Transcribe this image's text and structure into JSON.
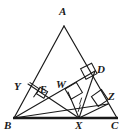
{
  "figure": {
    "type": "geometry-diagram",
    "background_color": "#ffffff",
    "stroke_color": "#1a1a1a",
    "label_color": "#1a1a1a",
    "canvas": {
      "width": 129,
      "height": 135
    }
  },
  "labels": {
    "A": "A",
    "B": "B",
    "C": "C",
    "D": "D",
    "E": "E",
    "W": "W",
    "X": "X",
    "Y": "Y",
    "Z": "Z"
  },
  "points": {
    "A": {
      "x": 64,
      "y": 26
    },
    "B": {
      "x": 14,
      "y": 118
    },
    "C": {
      "x": 117,
      "y": 118
    },
    "D": {
      "x": 94,
      "y": 72
    },
    "E": {
      "x": 41,
      "y": 92
    },
    "W": {
      "x": 68,
      "y": 92
    },
    "X": {
      "x": 79,
      "y": 118
    },
    "Y": {
      "x": 28,
      "y": 85
    },
    "Z": {
      "x": 107,
      "y": 104
    }
  },
  "label_positions": {
    "A": {
      "x": 59,
      "y": 7
    },
    "B": {
      "x": 5,
      "y": 120
    },
    "C": {
      "x": 112,
      "y": 120
    },
    "D": {
      "x": 98,
      "y": 65
    },
    "E": {
      "x": 40,
      "y": 86
    },
    "W": {
      "x": 58,
      "y": 80
    },
    "X": {
      "x": 75,
      "y": 120
    },
    "Y": {
      "x": 15,
      "y": 82
    },
    "Z": {
      "x": 109,
      "y": 92
    }
  },
  "segments": [
    {
      "name": "side-AB",
      "from": "A",
      "to": "B",
      "width": 1.2
    },
    {
      "name": "side-AC",
      "from": "A",
      "to": "C",
      "width": 1.2
    },
    {
      "name": "side-BC",
      "from": "B",
      "to": "C",
      "width": 2.6
    },
    {
      "name": "cevian-BD",
      "from": "B",
      "to": "D",
      "width": 1.1
    },
    {
      "name": "cevian-BZ",
      "from": "B",
      "to": "Z",
      "width": 1.1
    },
    {
      "name": "cevian-XD",
      "from": "X",
      "to": "D",
      "width": 1.1
    },
    {
      "name": "cevian-XZ",
      "from": "X",
      "to": "Z",
      "width": 1.1
    },
    {
      "name": "perpendicular-XW",
      "from": "X",
      "to": "W",
      "width": 1.1
    },
    {
      "name": "perpendicular-XY-via-E",
      "from": "X",
      "to": "Y",
      "width": 1.1
    }
  ],
  "right_angle_marks": [
    {
      "name": "right-angle-at-Y",
      "vertex": "Y",
      "size": 10
    },
    {
      "name": "right-angle-at-E",
      "vertex": "E",
      "size": 9
    },
    {
      "name": "right-angle-at-W",
      "vertex": "W",
      "size": 10
    },
    {
      "name": "right-angle-at-D",
      "vertex": "D",
      "size": 11
    },
    {
      "name": "right-angle-at-Z",
      "vertex": "Z",
      "size": 11
    }
  ],
  "notes": {
    "ticks": "short tick marks on segment XD near X",
    "line_style": "solid black ink lines on white background"
  }
}
